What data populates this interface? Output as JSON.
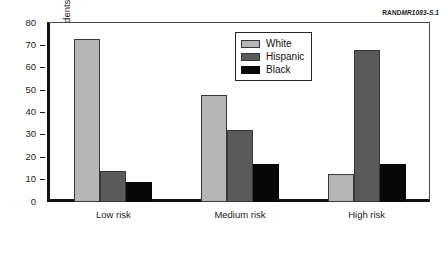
{
  "figure": {
    "id_prefix": "RAND",
    "id_number": "MR1083-S.1"
  },
  "chart_data": {
    "type": "bar",
    "title": "",
    "xlabel": "",
    "ylabel": "Percentage of students",
    "categories": [
      "Low risk",
      "Medium risk",
      "High risk"
    ],
    "series": [
      {
        "name": "White",
        "color": "#b6b6b6",
        "values": [
          73,
          48,
          12.5
        ]
      },
      {
        "name": "Hispanic",
        "color": "#5a5a5a",
        "values": [
          14,
          32,
          68
        ]
      },
      {
        "name": "Black",
        "color": "#080808",
        "values": [
          9,
          17,
          17
        ]
      }
    ],
    "ylim": [
      0,
      80
    ],
    "yticks": [
      0,
      10,
      20,
      30,
      40,
      50,
      60,
      70,
      80
    ],
    "ytick_labels": [
      "0",
      "10",
      "20",
      "30",
      "40",
      "50",
      "60",
      "70",
      "80"
    ],
    "grid": false,
    "legend_position": "upper center"
  }
}
